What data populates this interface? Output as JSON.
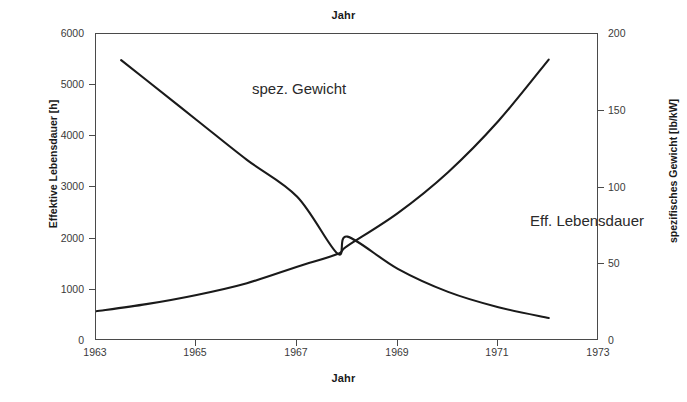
{
  "figure": {
    "title_top": "Jahr",
    "title_bottom": "Jahr",
    "background_color": "#ffffff",
    "line_color": "#1a1a1a",
    "axis_color": "#4a4a4a"
  },
  "axes": {
    "x": {
      "label": "Jahr",
      "ticks": [
        "1963",
        "1965",
        "1967",
        "1969",
        "1971",
        "1973"
      ],
      "min": 1963,
      "max": 1973
    },
    "y_left": {
      "label": "Effektive Lebensdauer [h]",
      "ticks": [
        "0",
        "1000",
        "2000",
        "3000",
        "4000",
        "5000",
        "6000"
      ],
      "min": 0,
      "max": 6000
    },
    "y_right": {
      "label": "spezifisches Gewicht [lb/kW]",
      "ticks": [
        "0",
        "50",
        "100",
        "150",
        "200"
      ],
      "min": 0,
      "max": 200
    }
  },
  "annotations": {
    "spez_gewicht": "spez. Gewicht",
    "eff_lebensdauer": "Eff. Lebensdauer"
  },
  "chart_data": {
    "type": "line",
    "title": "Jahr",
    "xlabel": "Jahr",
    "ylabel": "Effektive Lebensdauer [h]",
    "y2label": "spezifisches Gewicht [lb/kW]",
    "xlim": [
      1963,
      1973
    ],
    "ylim": [
      0,
      6000
    ],
    "y2lim": [
      0,
      200
    ],
    "grid": false,
    "legend": "inline-annotations",
    "x": [
      1963,
      1963.5,
      1964,
      1965,
      1966,
      1967,
      1967.8,
      1968,
      1969,
      1970,
      1971,
      1972
    ],
    "series": [
      {
        "name": "Eff. Lebensdauer",
        "axis": "left",
        "unit": "h",
        "x": [
          1963,
          1964,
          1965,
          1966,
          1967,
          1967.8,
          1968,
          1969,
          1970,
          1971,
          1972
        ],
        "values": [
          580,
          720,
          900,
          1130,
          1450,
          1700,
          1860,
          2500,
          3300,
          4300,
          5500
        ]
      },
      {
        "name": "spez. Gewicht",
        "axis": "right",
        "unit": "lb/kW",
        "x": [
          1963.5,
          1964,
          1965,
          1966,
          1967,
          1967.8,
          1968,
          1969,
          1970,
          1971,
          1972
        ],
        "values": [
          183,
          170,
          144,
          118,
          94,
          57,
          68,
          47,
          32,
          22,
          15
        ]
      }
    ],
    "crossing_point": {
      "x": 1967.8,
      "y_left": 1700,
      "y_right": 57
    }
  }
}
